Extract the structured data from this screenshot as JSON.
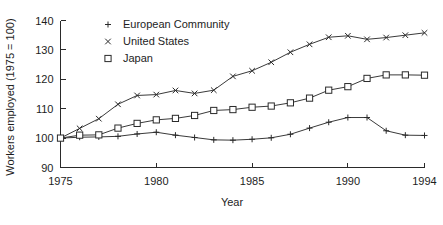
{
  "chart_data": {
    "type": "line",
    "title": "",
    "xlabel": "Year",
    "ylabel": "Workers employed (1975 = 100)",
    "xlim": [
      1975,
      1994
    ],
    "ylim": [
      90,
      140
    ],
    "xticks": [
      1975,
      1980,
      1985,
      1990,
      1994
    ],
    "yticks": [
      90,
      100,
      110,
      120,
      130,
      140
    ],
    "grid": false,
    "legend_position": "top-center",
    "x": [
      1975,
      1976,
      1977,
      1978,
      1979,
      1980,
      1981,
      1982,
      1983,
      1984,
      1985,
      1986,
      1987,
      1988,
      1989,
      1990,
      1991,
      1992,
      1993,
      1994
    ],
    "series": [
      {
        "name": "European Community",
        "marker": "plus",
        "values": [
          100.0,
          100.3,
          100.4,
          100.6,
          101.4,
          102.0,
          101.0,
          100.2,
          99.4,
          99.3,
          99.6,
          100.1,
          101.3,
          103.4,
          105.4,
          107.0,
          107.0,
          102.5,
          101.0,
          100.9
        ]
      },
      {
        "name": "United States",
        "marker": "cross",
        "values": [
          100.0,
          103.3,
          106.6,
          111.5,
          114.5,
          114.8,
          116.2,
          115.2,
          116.3,
          121.0,
          122.9,
          125.8,
          129.2,
          131.9,
          134.3,
          134.8,
          133.6,
          134.2,
          135.0,
          135.8
        ]
      },
      {
        "name": "Japan",
        "marker": "square",
        "values": [
          100.0,
          101.0,
          101.1,
          103.4,
          105.0,
          106.2,
          106.7,
          107.7,
          109.4,
          109.7,
          110.5,
          110.9,
          112.0,
          113.6,
          116.3,
          117.5,
          120.3,
          121.5,
          121.5,
          121.4
        ]
      }
    ]
  },
  "legend": {
    "items": [
      {
        "label": "European Community",
        "marker": "plus"
      },
      {
        "label": "United States",
        "marker": "cross"
      },
      {
        "label": "Japan",
        "marker": "square"
      }
    ]
  },
  "axes": {
    "y_title": "Workers employed (1975 = 100)",
    "x_title": "Year",
    "y_tick_labels": [
      "140",
      "130",
      "120",
      "110",
      "100",
      "90"
    ],
    "x_tick_labels": [
      "1975",
      "1980",
      "1985",
      "1990",
      "1994"
    ]
  },
  "colors": {
    "ink": "#2a2a2a",
    "line": "#3a3a3a",
    "background": "#ffffff"
  }
}
